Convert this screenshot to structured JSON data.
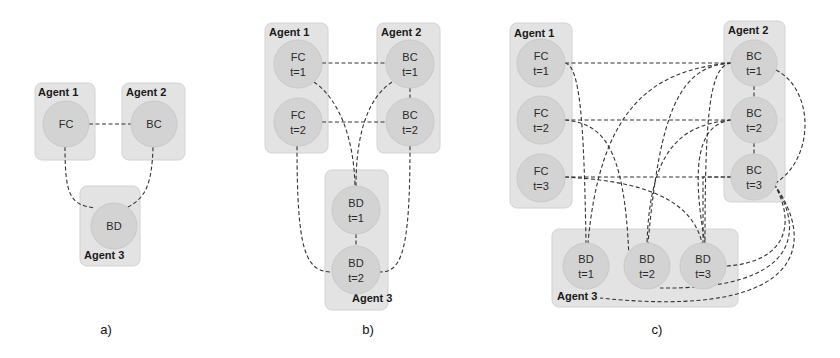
{
  "figure": {
    "panels": [
      {
        "id": "a",
        "label": "a)",
        "label_pos": [
          106,
          334
        ],
        "agents": [
          {
            "name": "Agent 1",
            "box": [
              35,
              83,
              60,
              77
            ],
            "label_pos": [
              38,
              96
            ]
          },
          {
            "name": "Agent 2",
            "box": [
              122,
              83,
              63,
              77
            ],
            "label_pos": [
              126,
              96
            ]
          },
          {
            "name": "Agent 3",
            "box": [
              80,
              186,
              60,
              80
            ],
            "label_pos": [
              84,
              259
            ]
          }
        ],
        "nodes": [
          {
            "id": "a-fc",
            "line1": "FC",
            "line2": "",
            "cx": 66,
            "cy": 124,
            "r": 23
          },
          {
            "id": "a-bc",
            "line1": "BC",
            "line2": "",
            "cx": 154,
            "cy": 124,
            "r": 23
          },
          {
            "id": "a-bd",
            "line1": "BD",
            "line2": "",
            "cx": 114,
            "cy": 226,
            "r": 23
          }
        ],
        "edges": [
          "M 89 124 L 131 124",
          "M 65 147 C 65 195, 70 205, 95 208",
          "M 153 147 C 152 185, 145 198, 128 207"
        ]
      },
      {
        "id": "b",
        "label": "b)",
        "label_pos": [
          368,
          334
        ],
        "agents": [
          {
            "name": "Agent 1",
            "box": [
              265,
              23,
              63,
              130
            ],
            "label_pos": [
              269,
              36
            ]
          },
          {
            "name": "Agent 2",
            "box": [
              377,
              23,
              63,
              130
            ],
            "label_pos": [
              381,
              36
            ]
          },
          {
            "name": "Agent 3",
            "box": [
              325,
              170,
              63,
              140
            ],
            "label_pos": [
              352,
              302
            ]
          }
        ],
        "nodes": [
          {
            "id": "b-fc1",
            "line1": "FC",
            "line2": "t=1",
            "cx": 298,
            "cy": 64,
            "r": 24
          },
          {
            "id": "b-fc2",
            "line1": "FC",
            "line2": "t=2",
            "cx": 298,
            "cy": 122,
            "r": 24
          },
          {
            "id": "b-bc1",
            "line1": "BC",
            "line2": "t=1",
            "cx": 410,
            "cy": 64,
            "r": 24
          },
          {
            "id": "b-bc2",
            "line1": "BC",
            "line2": "t=2",
            "cx": 410,
            "cy": 122,
            "r": 24
          },
          {
            "id": "b-bd1",
            "line1": "BD",
            "line2": "t=1",
            "cx": 356,
            "cy": 210,
            "r": 24
          },
          {
            "id": "b-bd2",
            "line1": "BD",
            "line2": "t=2",
            "cx": 356,
            "cy": 270,
            "r": 24
          }
        ],
        "edges": [
          "M 322 63 L 386 63",
          "M 322 122 L 386 122",
          "M 410 88 L 410 98",
          "M 356 234 L 356 246",
          "M 314 82 C 340 100, 354 140, 355 186",
          "M 392 82 C 365 100, 356 140, 356 186",
          "M 297 146 C 297 250, 305 272, 332 272",
          "M 410 146 C 410 250, 402 272, 380 272"
        ]
      },
      {
        "id": "c",
        "label": "c)",
        "label_pos": [
          657,
          334
        ],
        "agents": [
          {
            "name": "Agent 1",
            "box": [
              510,
              23,
              62,
              185
            ],
            "label_pos": [
              514,
              37
            ]
          },
          {
            "name": "Agent 2",
            "box": [
              724,
              21,
              61,
              181
            ],
            "label_pos": [
              728,
              34
            ]
          },
          {
            "name": "Agent 3",
            "box": [
              552,
              229,
              186,
              78
            ],
            "label_pos": [
              557,
              300
            ]
          }
        ],
        "nodes": [
          {
            "id": "c-fc1",
            "line1": "FC",
            "line2": "t=1",
            "cx": 541,
            "cy": 63,
            "r": 24
          },
          {
            "id": "c-fc2",
            "line1": "FC",
            "line2": "t=2",
            "cx": 541,
            "cy": 120,
            "r": 24
          },
          {
            "id": "c-fc3",
            "line1": "FC",
            "line2": "t=3",
            "cx": 541,
            "cy": 178,
            "r": 24
          },
          {
            "id": "c-bc1",
            "line1": "BC",
            "line2": "t=1",
            "cx": 754,
            "cy": 63,
            "r": 23
          },
          {
            "id": "c-bc2",
            "line1": "BC",
            "line2": "t=2",
            "cx": 754,
            "cy": 120,
            "r": 23
          },
          {
            "id": "c-bc3",
            "line1": "BC",
            "line2": "t=3",
            "cx": 754,
            "cy": 177,
            "r": 23
          },
          {
            "id": "c-bd1",
            "line1": "BD",
            "line2": "t=1",
            "cx": 586,
            "cy": 266,
            "r": 23
          },
          {
            "id": "c-bd2",
            "line1": "BD",
            "line2": "t=2",
            "cx": 647,
            "cy": 266,
            "r": 23
          },
          {
            "id": "c-bd3",
            "line1": "BD",
            "line2": "t=3",
            "cx": 703,
            "cy": 266,
            "r": 23
          }
        ],
        "edges": [
          "M 565 63 L 731 63",
          "M 565 120 L 731 120",
          "M 565 177 L 731 177",
          "M 754 86 L 754 97",
          "M 754 143 L 754 154",
          "M 565 63 C 580 66, 584 120, 586 243",
          "M 565 120 C 600 124, 625 140, 629 260",
          "M 565 177 C 620 180, 690 190, 702 243",
          "M 731 63 C 650 70, 600 110, 588 243",
          "M 731 120 C 680 125, 650 150, 647 243",
          "M 731 177 L 703 177 C 703 200, 703 230, 703 243",
          "M 731 63 C 680 66, 660 110, 648 243",
          "M 731 120 C 700 124, 690 160, 705 243",
          "M 731 63 C 710 66, 705 110, 705 243",
          "M 776 70 C 815 90, 815 160, 774 184",
          "M 774 184 C 795 220, 790 262, 726 266",
          "M 774 184 C 805 230, 800 290, 660 288",
          "M 774 184 C 815 240, 810 320, 600 298"
        ]
      }
    ]
  }
}
